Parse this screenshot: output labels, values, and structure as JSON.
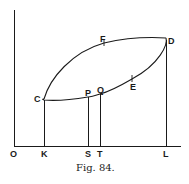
{
  "figure": {
    "caption": "Fig. 84.",
    "ink_color": "#1a1a1a",
    "background": "#ffffff"
  },
  "points": {
    "O": "O",
    "K": "K",
    "S": "S",
    "T": "T",
    "L": "L",
    "C": "C",
    "D": "D",
    "F": "F",
    "E": "E",
    "P": "P",
    "Q": "Q"
  }
}
